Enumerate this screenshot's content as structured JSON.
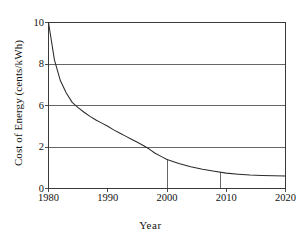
{
  "chart_data": {
    "type": "line",
    "title": "",
    "xlabel": "Year",
    "ylabel": "Cost of Energy (cents/kWh)",
    "xlim": [
      1980,
      2020
    ],
    "ylim": [
      0,
      10
    ],
    "grid": true,
    "legend": "none",
    "x_ticks": [
      {
        "value": 1980,
        "label": "1980"
      },
      {
        "value": 1990,
        "label": "1990"
      },
      {
        "value": 2000,
        "label": "2000"
      },
      {
        "value": 2010,
        "label": "2010"
      },
      {
        "value": 2020,
        "label": "2020"
      }
    ],
    "y_ticks": [
      {
        "value": 10,
        "label": "10"
      },
      {
        "value": 8,
        "label": "8"
      },
      {
        "value": 6,
        "label": "6"
      },
      {
        "value": 2,
        "label": "2"
      },
      {
        "value": 0,
        "label": "0"
      }
    ],
    "gridlines_y": [
      10,
      8,
      6,
      2
    ],
    "series": [
      {
        "name": "Cost of Energy",
        "x": [
          1980,
          1981,
          1982,
          1983,
          1984,
          1985,
          1986,
          1987,
          1988,
          1989,
          1990,
          1991,
          1992,
          1993,
          1994,
          1995,
          1996,
          1997,
          1998,
          1999,
          2000,
          2002,
          2004,
          2006,
          2008,
          2010,
          2012,
          2014,
          2016,
          2018,
          2020
        ],
        "values": [
          10.0,
          8.2,
          7.2,
          6.6,
          6.15,
          5.8,
          5.35,
          4.95,
          4.6,
          4.3,
          4.0,
          3.65,
          3.35,
          3.05,
          2.75,
          2.45,
          2.15,
          1.9,
          1.7,
          1.55,
          1.4,
          1.2,
          1.05,
          0.93,
          0.83,
          0.74,
          0.69,
          0.65,
          0.63,
          0.61,
          0.6
        ]
      }
    ],
    "marker_lines": [
      {
        "year": 2000,
        "value": 1.4
      },
      {
        "year": 2009,
        "value": 0.78
      }
    ],
    "colors": {
      "curve": "#2b2b2b",
      "grid": "#555555",
      "axis": "#3a3a3a",
      "background": "#ffffff",
      "text": "#111111"
    }
  }
}
